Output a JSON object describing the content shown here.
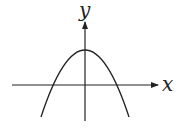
{
  "diagram": {
    "type": "function-graph",
    "axes": {
      "x_label": "x",
      "y_label": "y"
    },
    "curve": {
      "kind": "parabola",
      "opens": "down",
      "vertex_on_y_axis": true,
      "vertex_above_x_axis": true,
      "x_intercepts": 2
    },
    "colors": {
      "stroke": "#222222",
      "background": "#ffffff"
    }
  }
}
